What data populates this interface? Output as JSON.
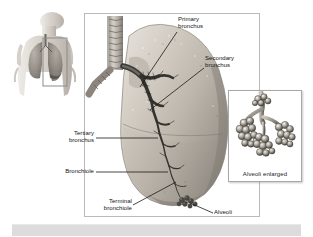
{
  "figure": {
    "palette": {
      "page_background": "#ffffff",
      "panel_border": "#b9b9b9",
      "inset_border": "#a8a8a8",
      "label_text": "#131313",
      "leader_line": "#1a1a1a",
      "caption_bar": "#dcdcdc",
      "lung_light": "#d9d4cc",
      "lung_mid": "#b5afa6",
      "lung_shadow": "#8e8881",
      "trachea": "#b8b3aa",
      "bronchi_dark": "#3c3a36",
      "alveoli_light": "#cfcac2",
      "alveoli_dark": "#4a4742",
      "torso_skin": "#d7d2cb",
      "torso_lung": "#9a948c",
      "highlight_box": "#8d8d8d"
    }
  },
  "thumbnail": {
    "name": "torso-with-lungs",
    "description": "Human upper torso showing both lungs with a highlight rectangle over the right lung region"
  },
  "main_panel": {
    "name": "lung-bronchial-tree",
    "description": "Cutaway of a lung with trachea and branching bronchial tree"
  },
  "labels": [
    {
      "id": "primary-bronchus",
      "text": "Primary\nbronchus"
    },
    {
      "id": "secondary-bronchus",
      "text": "Secondary\nbronchus"
    },
    {
      "id": "tertiary-bronchus",
      "text": "Tertiary\nbronchus"
    },
    {
      "id": "bronchiole",
      "text": "Bronchiole"
    },
    {
      "id": "terminal-bronchiole",
      "text": "Terminal\nbronchiole"
    },
    {
      "id": "alveoli",
      "text": "Alveoli"
    }
  ],
  "inset": {
    "name": "alveoli-enlarged",
    "caption": "Alveoli enlarged",
    "description": "Magnified grape-like cluster of alveolar sacs at the end of a bronchiole"
  },
  "caption_bar": {
    "text": ""
  }
}
